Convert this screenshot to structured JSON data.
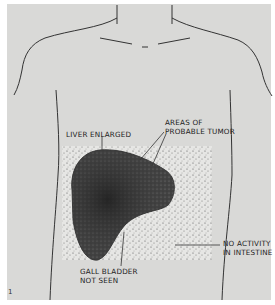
{
  "figure": {
    "type": "anatomical diagram with liver scintiscan inset",
    "labels": {
      "liver_enlarged": "LIVER ENLARGED",
      "tumor_line1": "AREAS OF",
      "tumor_line2": "PROBABLE TUMOR",
      "intestine_line1": "NO ACTIVITY",
      "intestine_line2": "IN INTESTINE",
      "gall_line1": "GALL BLADDER",
      "gall_line2": "NOT SEEN"
    },
    "figure_number": "1",
    "colors": {
      "background": "#d9d9d7",
      "scan_background": "#e8e8e6",
      "scan_dots": "#2a2a2a",
      "outline": "#333333"
    }
  }
}
